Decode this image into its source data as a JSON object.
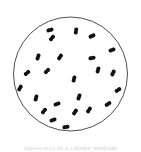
{
  "figure": {
    "caption": "diplococci in a culture medium",
    "background_color": "#ffffff"
  },
  "dish": {
    "name": "culture-dish",
    "center_x": 70.5,
    "center_y": 74,
    "radius": 57,
    "stroke_color": "#3a3a3a",
    "stroke_width": 0.9,
    "fill_color": "#ffffff"
  },
  "colony": {
    "organism_label": "diplococcus",
    "count": 24,
    "cell_color": "#111111",
    "cell_radius": 2.0,
    "pair_gap": 3.2,
    "cells": [
      {
        "id": 1,
        "x": 50,
        "y": 30,
        "angle": 75
      },
      {
        "id": 2,
        "x": 52,
        "y": 38,
        "angle": 40
      },
      {
        "id": 3,
        "x": 76,
        "y": 31,
        "angle": 10
      },
      {
        "id": 4,
        "x": 92,
        "y": 36,
        "angle": 65
      },
      {
        "id": 5,
        "x": 38,
        "y": 57,
        "angle": 20
      },
      {
        "id": 6,
        "x": 60,
        "y": 57,
        "angle": 35
      },
      {
        "id": 7,
        "x": 92,
        "y": 58,
        "angle": 80
      },
      {
        "id": 8,
        "x": 112,
        "y": 50,
        "angle": 70
      },
      {
        "id": 9,
        "x": 27,
        "y": 73,
        "angle": 50
      },
      {
        "id": 10,
        "x": 47,
        "y": 71,
        "angle": 45
      },
      {
        "id": 11,
        "x": 74,
        "y": 79,
        "angle": 15
      },
      {
        "id": 12,
        "x": 98,
        "y": 70,
        "angle": 15
      },
      {
        "id": 13,
        "x": 113,
        "y": 73,
        "angle": 25
      },
      {
        "id": 14,
        "x": 118,
        "y": 90,
        "angle": 55
      },
      {
        "id": 15,
        "x": 36,
        "y": 98,
        "angle": 15
      },
      {
        "id": 16,
        "x": 79,
        "y": 97,
        "angle": 20
      },
      {
        "id": 17,
        "x": 57,
        "y": 104,
        "angle": 70
      },
      {
        "id": 18,
        "x": 108,
        "y": 104,
        "angle": 55
      },
      {
        "id": 19,
        "x": 44,
        "y": 111,
        "angle": 40
      },
      {
        "id": 20,
        "x": 75,
        "y": 112,
        "angle": 35
      },
      {
        "id": 21,
        "x": 89,
        "y": 110,
        "angle": 35
      },
      {
        "id": 22,
        "x": 53,
        "y": 120,
        "angle": 70
      },
      {
        "id": 23,
        "x": 66,
        "y": 127,
        "angle": 80
      },
      {
        "id": 24,
        "x": 20,
        "y": 88,
        "angle": 30
      }
    ]
  }
}
